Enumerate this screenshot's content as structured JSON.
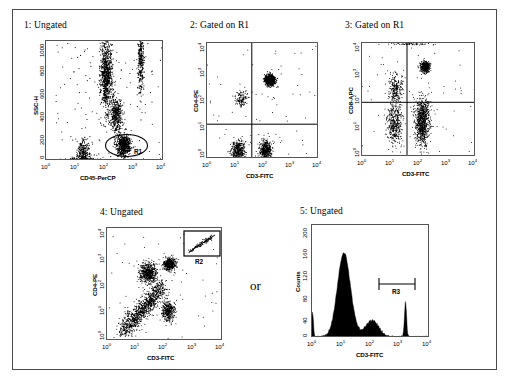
{
  "figure": {
    "width": 509,
    "height": 384,
    "border_color": "#4a4a4a",
    "background": "#ffffff",
    "connector_text": "or"
  },
  "panels": [
    {
      "id": "panel-1",
      "title": "1: Ungated",
      "xlabel": "CD45-PerCP",
      "ylabel": "SSC-H",
      "xscale": "log",
      "yscale": "linear",
      "xticks": [
        "10⁰",
        "10¹",
        "10²",
        "10³",
        "10⁴"
      ],
      "xtick_exps": [
        "0",
        "1",
        "2",
        "3",
        "4"
      ],
      "yticks": [
        "0",
        "200",
        "400",
        "600",
        "800",
        "1000"
      ],
      "gate": "R1",
      "gate_shape": "ellipse",
      "quadrants": false
    },
    {
      "id": "panel-2",
      "title": "2: Gated on R1",
      "xlabel": "CD3-FITC",
      "ylabel": "CD4-PE",
      "xscale": "log",
      "yscale": "log",
      "xticks": [
        "10⁰",
        "10¹",
        "10²",
        "10³",
        "10⁴"
      ],
      "xtick_exps": [
        "0",
        "1",
        "2",
        "3",
        "4"
      ],
      "yticks": [
        "10⁰",
        "10¹",
        "10²",
        "10³",
        "10⁴"
      ],
      "ytick_exps": [
        "0",
        "1",
        "2",
        "3",
        "4"
      ],
      "quadrants": true
    },
    {
      "id": "panel-3",
      "title": "3: Gated on R1",
      "xlabel": "CD3-FITC",
      "ylabel": "CD8-APC",
      "xscale": "log",
      "yscale": "log",
      "xticks": [
        "10⁰",
        "10¹",
        "10²",
        "10³",
        "10⁴"
      ],
      "xtick_exps": [
        "0",
        "1",
        "2",
        "3",
        "4"
      ],
      "yticks": [
        "10⁰",
        "10¹",
        "10²",
        "10³",
        "10⁴"
      ],
      "ytick_exps": [
        "0",
        "1",
        "2",
        "3",
        "4"
      ],
      "quadrants": true
    },
    {
      "id": "panel-4",
      "title": "4: Ungated",
      "xlabel": "CD3-FITC",
      "ylabel": "CD4-PE",
      "xscale": "log",
      "yscale": "log",
      "xticks": [
        "10⁰",
        "10¹",
        "10²",
        "10³",
        "10⁴"
      ],
      "xtick_exps": [
        "0",
        "1",
        "2",
        "3",
        "4"
      ],
      "yticks": [
        "10⁰",
        "10¹",
        "10²",
        "10³",
        "10⁴"
      ],
      "ytick_exps": [
        "0",
        "1",
        "2",
        "3",
        "4"
      ],
      "gate": "R2",
      "gate_shape": "rectangle",
      "quadrants": false
    },
    {
      "id": "panel-5",
      "title": "5: Ungated",
      "xlabel": "CD3-FITC",
      "ylabel": "Counts",
      "xscale": "log",
      "yscale": "linear",
      "xticks": [
        "10⁰",
        "10¹",
        "10²",
        "10³",
        "10⁴"
      ],
      "xtick_exps": [
        "0",
        "1",
        "2",
        "3",
        "4"
      ],
      "yticks": [
        "0",
        "40",
        "80",
        "120",
        "160",
        "200"
      ],
      "gate": "R3",
      "gate_shape": "marker-bar",
      "quadrants": false
    }
  ],
  "chart_data": [
    {
      "type": "scatter",
      "id": "panel-1",
      "title": "1: Ungated",
      "xlabel": "CD45-PerCP",
      "ylabel": "SSC-H",
      "xscale": "log",
      "yscale": "linear",
      "xlim": [
        1,
        10000
      ],
      "ylim": [
        0,
        1000
      ],
      "xticks": [
        1,
        10,
        100,
        1000,
        10000
      ],
      "yticks": [
        0,
        200,
        400,
        600,
        800,
        1000
      ],
      "grid": false,
      "legend": "none",
      "annotations": [
        {
          "text": "R1",
          "type": "gate-ellipse",
          "cx_log": 2.62,
          "cy": 130,
          "rx_log": 0.42,
          "ry": 75
        }
      ],
      "populations": [
        {
          "name": "granulocytes",
          "cx_log": 2.05,
          "cy": 720,
          "n": 900,
          "sx_log": 0.1,
          "sy": 150
        },
        {
          "name": "granulocyte-tail",
          "cx_log": 3.22,
          "cy": 830,
          "n": 320,
          "sx_log": 0.05,
          "sy": 140
        },
        {
          "name": "monocytes",
          "cx_log": 2.38,
          "cy": 390,
          "n": 420,
          "sx_log": 0.11,
          "sy": 70
        },
        {
          "name": "lymphocytes",
          "cx_log": 2.63,
          "cy": 130,
          "n": 700,
          "sx_log": 0.12,
          "sy": 45
        },
        {
          "name": "debris",
          "cx_log": 1.28,
          "cy": 60,
          "n": 300,
          "sx_log": 0.1,
          "sy": 60
        },
        {
          "name": "noise-floor",
          "cx_log": 1.2,
          "cy": 8,
          "n": 260,
          "sx_log": 0.3,
          "sy": 8
        }
      ]
    },
    {
      "type": "scatter",
      "id": "panel-2",
      "title": "2: Gated on R1",
      "xlabel": "CD3-FITC",
      "ylabel": "CD4-PE",
      "xscale": "log",
      "yscale": "log",
      "xlim": [
        1,
        10000
      ],
      "ylim": [
        1,
        10000
      ],
      "xticks": [
        1,
        10,
        100,
        1000,
        10000
      ],
      "yticks": [
        1,
        10,
        100,
        1000,
        10000
      ],
      "grid": false,
      "legend": "none",
      "quadrant_x_log": 1.6,
      "quadrant_y_log": 1.2,
      "populations": [
        {
          "name": "CD3+CD4+",
          "cx_log": 2.25,
          "cy_log": 2.72,
          "n": 900,
          "sx_log": 0.09,
          "sy_log": 0.09
        },
        {
          "name": "CD3-CD4dim",
          "cx_log": 1.22,
          "cy_log": 2.07,
          "n": 120,
          "sx_log": 0.1,
          "sy_log": 0.12
        },
        {
          "name": "CD3-CD4-",
          "cx_log": 1.12,
          "cy_log": 0.28,
          "n": 420,
          "sx_log": 0.13,
          "sy_log": 0.18
        },
        {
          "name": "CD3+CD4-",
          "cx_log": 2.1,
          "cy_log": 0.3,
          "n": 430,
          "sx_log": 0.11,
          "sy_log": 0.18
        }
      ]
    },
    {
      "type": "scatter",
      "id": "panel-3",
      "title": "3: Gated on R1",
      "xlabel": "CD3-FITC",
      "ylabel": "CD8-APC",
      "xscale": "log",
      "yscale": "log",
      "xlim": [
        1,
        10000
      ],
      "ylim": [
        1,
        10000
      ],
      "xticks": [
        1,
        10,
        100,
        1000,
        10000
      ],
      "yticks": [
        1,
        10,
        100,
        1000,
        10000
      ],
      "grid": false,
      "legend": "none",
      "quadrant_x_log": 1.58,
      "quadrant_y_log": 1.92,
      "populations": [
        {
          "name": "CD3+CD8+",
          "cx_log": 2.22,
          "cy_log": 3.16,
          "n": 520,
          "sx_log": 0.08,
          "sy_log": 0.09
        },
        {
          "name": "CD3-CD8dim",
          "cx_log": 1.18,
          "cy_log": 2.35,
          "n": 260,
          "sx_log": 0.12,
          "sy_log": 0.3
        },
        {
          "name": "CD3-CD8-",
          "cx_log": 1.15,
          "cy_log": 1.15,
          "n": 400,
          "sx_log": 0.13,
          "sy_log": 0.35
        },
        {
          "name": "CD3+CD8-",
          "cx_log": 2.12,
          "cy_log": 1.25,
          "n": 900,
          "sx_log": 0.13,
          "sy_log": 0.4
        },
        {
          "name": "saturated-top",
          "cx_log": 1.7,
          "cy_log": 3.97,
          "n": 60,
          "sx_log": 0.35,
          "sy_log": 0.02
        }
      ]
    },
    {
      "type": "scatter",
      "id": "panel-4",
      "title": "4: Ungated",
      "xlabel": "CD3-FITC",
      "ylabel": "CD4-PE",
      "xscale": "log",
      "yscale": "log",
      "xlim": [
        1,
        10000
      ],
      "ylim": [
        1,
        10000
      ],
      "xticks": [
        1,
        10,
        100,
        1000,
        10000
      ],
      "yticks": [
        1,
        10,
        100,
        1000,
        10000
      ],
      "grid": false,
      "legend": "none",
      "annotations": [
        {
          "text": "R2",
          "type": "gate-rect",
          "x0_log": 2.66,
          "x1_log": 3.97,
          "y0_log": 3.12,
          "y1_log": 3.98
        }
      ],
      "populations": [
        {
          "name": "CD3+CD4+",
          "cx_log": 2.15,
          "cy_log": 2.72,
          "n": 620,
          "sx_log": 0.1,
          "sy_log": 0.1
        },
        {
          "name": "monocytes-CD4dim",
          "cx_log": 1.42,
          "cy_log": 2.4,
          "n": 620,
          "sx_log": 0.14,
          "sy_log": 0.17
        },
        {
          "name": "diagonal-smear",
          "cx_log": 1.22,
          "cy_log": 1.25,
          "n": 1100,
          "sx_log": 0.26,
          "sy_log": 0.38
        },
        {
          "name": "CD3+CD4-",
          "cx_log": 2.12,
          "cy_log": 1.05,
          "n": 380,
          "sx_log": 0.11,
          "sy_log": 0.18
        },
        {
          "name": "R2-diagonal",
          "cx_log": 3.12,
          "cy_log": 3.45,
          "n": 70,
          "sx_log": 0.14,
          "sy_log": 0.14
        }
      ]
    },
    {
      "type": "histogram",
      "id": "panel-5",
      "title": "5: Ungated",
      "xlabel": "CD3-FITC",
      "ylabel": "Counts",
      "xscale": "log",
      "yscale": "linear",
      "xlim": [
        1,
        10000
      ],
      "ylim": [
        0,
        200
      ],
      "xticks": [
        1,
        10,
        100,
        1000,
        10000
      ],
      "yticks": [
        0,
        40,
        80,
        120,
        160,
        200
      ],
      "grid": false,
      "legend": "none",
      "annotations": [
        {
          "text": "R3",
          "type": "marker-bar",
          "x0_log": 2.68,
          "x1_log": 3.72,
          "y": 95
        }
      ],
      "peaks": [
        {
          "name": "negative-peak",
          "center_log": 1.08,
          "height": 148,
          "width_log": 0.22
        },
        {
          "name": "dim-peak",
          "center_log": 2.05,
          "height": 28,
          "width_log": 0.22
        },
        {
          "name": "bright-peak",
          "center_log": 3.17,
          "height": 62,
          "width_log": 0.035
        },
        {
          "name": "left-edge",
          "center_log": 0.02,
          "height": 42,
          "width_log": 0.03
        }
      ]
    }
  ]
}
